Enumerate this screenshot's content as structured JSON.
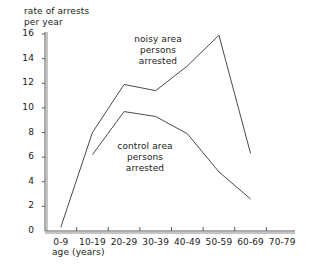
{
  "chart_data": {
    "type": "line",
    "title": "",
    "ylabel": "rate of arrests\nper year",
    "xlabel": "age (years)",
    "categories": [
      "0-9",
      "10-19",
      "20-29",
      "30-39",
      "40-49",
      "50-59",
      "60-69",
      "70-79"
    ],
    "ylim": [
      0,
      16
    ],
    "yticks": [
      0,
      2,
      4,
      6,
      8,
      10,
      12,
      14,
      16
    ],
    "ytick_labels": [
      "0",
      "2",
      "4",
      "6",
      "8",
      "10",
      "12",
      "14",
      "16"
    ],
    "grid": false,
    "legend_position": "inline-annotation",
    "series": [
      {
        "name": "noisy area persons arrested",
        "label": "noisy area\npersons\narrested",
        "x": [
          "0-9",
          "10-19",
          "20-29",
          "30-39",
          "40-49",
          "50-59",
          "60-69"
        ],
        "values": [
          0.3,
          8.0,
          11.9,
          11.4,
          13.4,
          15.9,
          6.3
        ]
      },
      {
        "name": "control area persons arrested",
        "label": "control area\npersons\narrested",
        "x": [
          "10-19",
          "20-29",
          "30-39",
          "40-49",
          "50-59",
          "60-69"
        ],
        "values": [
          6.2,
          9.7,
          9.3,
          7.9,
          4.8,
          2.6
        ]
      }
    ]
  },
  "axes": {
    "y_title_line1": "rate of arrests",
    "y_title_line2": "per year",
    "x_title": "age (years)"
  }
}
